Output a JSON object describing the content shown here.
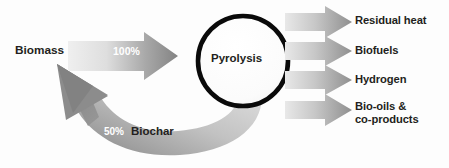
{
  "diagram": {
    "process": {
      "name": "Pyrolysis",
      "shape": "circle",
      "stroke_color": "#000000",
      "fill_color": "#fcfcfc"
    },
    "input": {
      "label": "Biomass",
      "flow_value": "100%",
      "flow_value_color": "#ffffff",
      "arrow_direction": "right",
      "arrow_gradient_from": "#e9e9e9",
      "arrow_gradient_to": "#8e8e8e"
    },
    "recycle": {
      "flow_value": "50%",
      "flow_value_color": "#ffffff",
      "label": "Biochar",
      "label_color": "#231f20",
      "arrow_direction": "curved-left-up",
      "arrow_gradient_from": "#cfcfcf",
      "arrow_gradient_to": "#8a8a8a"
    },
    "outputs": [
      {
        "label": "Residual heat",
        "lines": [
          "Residual heat"
        ]
      },
      {
        "label": "Biofuels",
        "lines": [
          "Biofuels"
        ]
      },
      {
        "label": "Hydrogen",
        "lines": [
          "Hydrogen"
        ]
      },
      {
        "label": "Bio-oils & co-products",
        "lines": [
          "Bio-oils &",
          "co-products"
        ]
      }
    ],
    "output_label_color": "#231f20",
    "output_arrow_gradient_from": "#e4e4e4",
    "output_arrow_gradient_to": "#949494",
    "background_color": "#fdfdfd"
  }
}
